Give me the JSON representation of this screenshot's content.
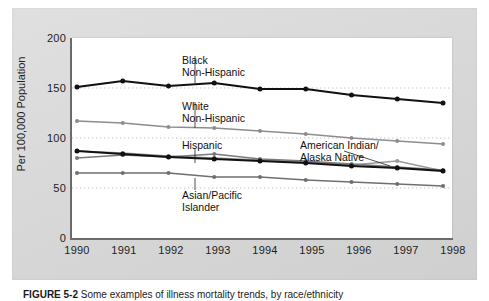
{
  "figure": {
    "caption_label": "FIGURE 5-2",
    "caption_text": "Some examples of illness mortality trends, by race/ethnicity"
  },
  "chart_data": {
    "type": "line",
    "title": "",
    "xlabel": "",
    "ylabel": "Per 100,000 Population",
    "x": [
      1990,
      1991,
      1992,
      1993,
      1994,
      1995,
      1996,
      1997,
      1998
    ],
    "categories": [
      "1990",
      "1991",
      "1992",
      "1993",
      "1994",
      "1995",
      "1996",
      "1997",
      "1998"
    ],
    "xlim": [
      1990,
      1998
    ],
    "ylim": [
      0,
      200
    ],
    "yticks": [
      0,
      50,
      100,
      150,
      200
    ],
    "ytick_labels": [
      "0",
      "50",
      "100",
      "150",
      "200"
    ],
    "grid": "horizontal-dotted",
    "legend": "inline-annotations",
    "series": [
      {
        "name": "Black Non-Hispanic",
        "color": "#111111",
        "width": 2.2,
        "values": [
          151,
          157,
          152,
          155,
          149,
          149,
          143,
          139,
          135
        ]
      },
      {
        "name": "White Non-Hispanic",
        "color": "#8d8d8d",
        "width": 1.6,
        "values": [
          117,
          115,
          111,
          110,
          107,
          104,
          100,
          97,
          94
        ]
      },
      {
        "name": "Hispanic",
        "color": "#7a7a7a",
        "width": 1.6,
        "values": [
          80,
          83,
          81,
          84,
          79,
          77,
          74,
          71,
          68
        ]
      },
      {
        "name": "American Indian/Alaska Native",
        "color": "#9a9a9a",
        "width": 1.6,
        "values": [
          87,
          85,
          82,
          80,
          78,
          76,
          73,
          77,
          67
        ]
      },
      {
        "name": "Asian/Pacific Islander",
        "color": "#6f6f6f",
        "width": 1.6,
        "values": [
          65,
          65,
          65,
          61,
          61,
          58,
          56,
          54,
          52
        ]
      }
    ],
    "black_overlay": {
      "name": "Black Non-Hispanic overlay (lower bold trace)",
      "color": "#111111",
      "values": [
        87,
        84,
        81,
        79,
        77,
        75,
        72,
        70,
        67
      ]
    },
    "annotations": [
      {
        "name": "Black Non-Hispanic",
        "lines": [
          "Black",
          "Non-Hispanic"
        ]
      },
      {
        "name": "White Non-Hispanic",
        "lines": [
          "White",
          "Non-Hispanic"
        ]
      },
      {
        "name": "Hispanic",
        "lines": [
          "Hispanic"
        ]
      },
      {
        "name": "Asian/Pacific Islander",
        "lines": [
          "Asian/Pacific",
          "Islander"
        ]
      },
      {
        "name": "American Indian/Alaska Native",
        "lines": [
          "American Indian/",
          "Alaska Native"
        ]
      }
    ]
  },
  "annot": {
    "black_l1": "Black",
    "black_l2": "Non-Hispanic",
    "white_l1": "White",
    "white_l2": "Non-Hispanic",
    "hispanic_l1": "Hispanic",
    "asian_l1": "Asian/Pacific",
    "asian_l2": "Islander",
    "ai_l1": "American Indian/",
    "ai_l2": "Alaska Native"
  },
  "axis": {
    "y_title": "Per 100,000 Population",
    "y_ticks": [
      "200",
      "150",
      "100",
      "50",
      "0"
    ],
    "x_ticks": [
      "1990",
      "1991",
      "1992",
      "1993",
      "1994",
      "1995",
      "1996",
      "1997",
      "1998"
    ]
  }
}
